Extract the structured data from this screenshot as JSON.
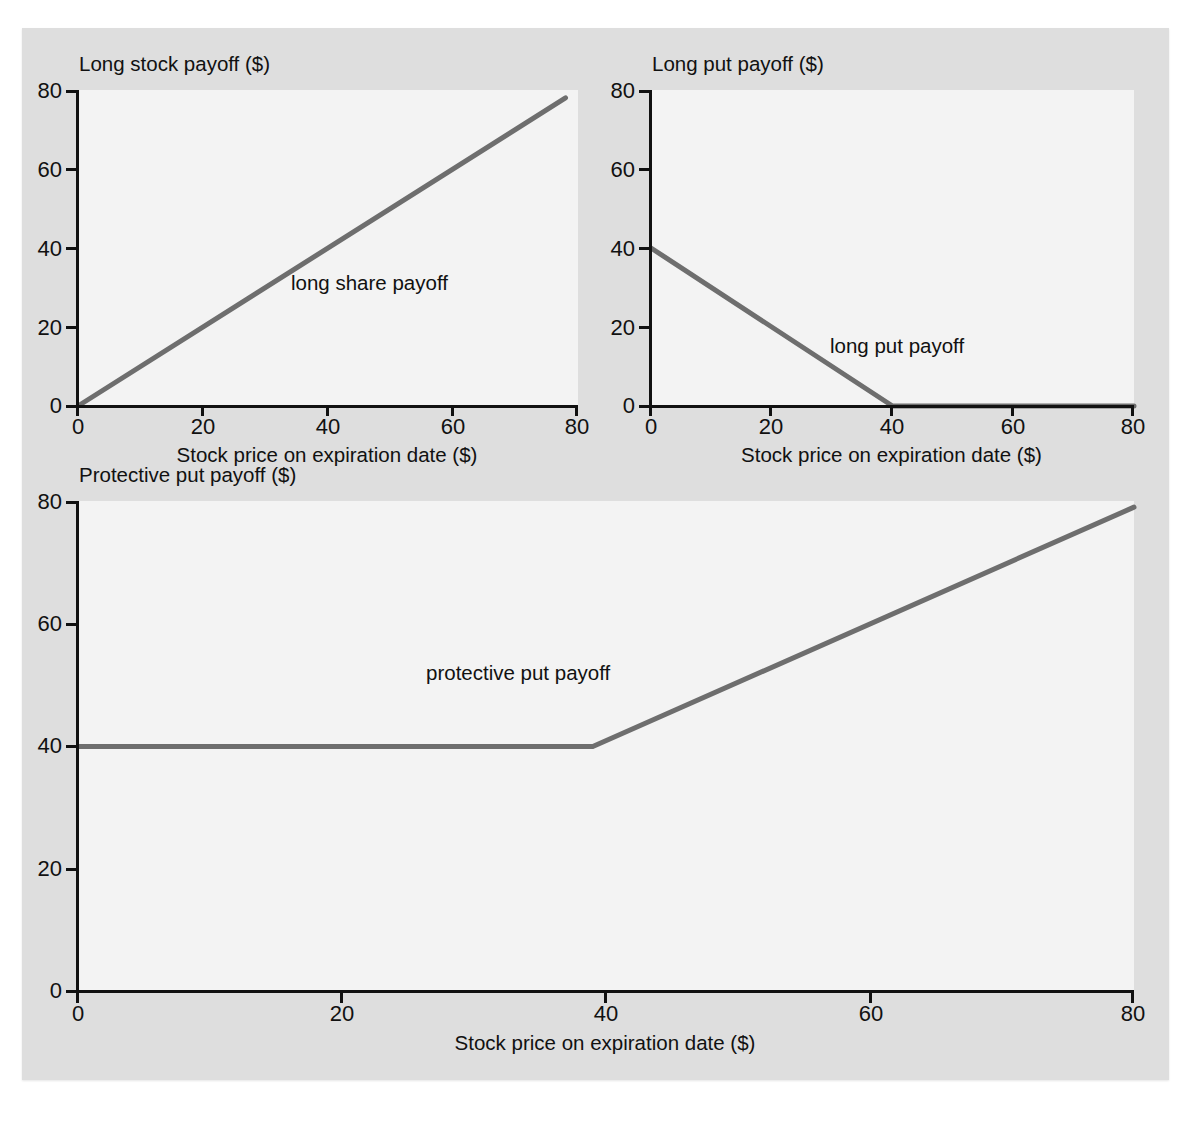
{
  "figure": {
    "cut_off_header_text": "",
    "line_color": "#6e6e6e",
    "axis_color": "#111111",
    "plot_bg_color": "#f3f3f3",
    "figure_bg_color": "#dedede"
  },
  "axis_caption": "Stock price on expiration date ($)",
  "panels": [
    {
      "id": "long-stock",
      "title": "Long stock payoff ($)",
      "annotation": "long share payoff",
      "xlabel": "Stock price on expiration date ($)",
      "xticks": [
        "0",
        "20",
        "40",
        "60",
        "80"
      ],
      "yticks": [
        "80",
        "60",
        "40",
        "20",
        "0"
      ]
    },
    {
      "id": "long-put",
      "title": "Long put payoff ($)",
      "annotation": "long put payoff",
      "xlabel": "Stock price on expiration date ($)",
      "xticks": [
        "0",
        "20",
        "40",
        "60",
        "80"
      ],
      "yticks": [
        "80",
        "60",
        "40",
        "20",
        "0"
      ]
    },
    {
      "id": "protective-put",
      "title": "Protective put payoff ($)",
      "annotation": "protective put payoff",
      "xlabel": "Stock price on expiration date ($)",
      "xticks": [
        "0",
        "20",
        "40",
        "60",
        "80"
      ],
      "yticks": [
        "80",
        "60",
        "40",
        "20",
        "0"
      ]
    }
  ],
  "chart_data": [
    {
      "type": "line",
      "title": "Long stock payoff ($)",
      "xlabel": "Stock price on expiration date ($)",
      "ylabel": "Long stock payoff ($)",
      "xlim": [
        0,
        80
      ],
      "ylim": [
        0,
        80
      ],
      "xticks": [
        0,
        20,
        40,
        60,
        80
      ],
      "yticks": [
        0,
        20,
        40,
        60,
        80
      ],
      "grid": false,
      "legend": "none",
      "annotations": [
        {
          "text": "long share payoff",
          "x": 34,
          "y": 31
        }
      ],
      "series": [
        {
          "name": "long share payoff",
          "color": "#6e6e6e",
          "x": [
            0,
            78
          ],
          "values": [
            0,
            78
          ]
        }
      ]
    },
    {
      "type": "line",
      "title": "Long put payoff ($)",
      "xlabel": "Stock price on expiration date ($)",
      "ylabel": "Long put payoff ($)",
      "xlim": [
        0,
        80
      ],
      "ylim": [
        0,
        80
      ],
      "xticks": [
        0,
        20,
        40,
        60,
        80
      ],
      "yticks": [
        0,
        20,
        40,
        60,
        80
      ],
      "grid": false,
      "legend": "none",
      "annotations": [
        {
          "text": "long put payoff",
          "x": 46,
          "y": 15
        }
      ],
      "series": [
        {
          "name": "long put payoff",
          "color": "#6e6e6e",
          "x": [
            0,
            40,
            80
          ],
          "values": [
            40,
            0,
            0
          ]
        }
      ]
    },
    {
      "type": "line",
      "title": "Protective put payoff ($)",
      "xlabel": "Stock price on expiration date ($)",
      "ylabel": "Protective put payoff ($)",
      "xlim": [
        0,
        80
      ],
      "ylim": [
        0,
        80
      ],
      "xticks": [
        0,
        20,
        40,
        60,
        80
      ],
      "yticks": [
        0,
        20,
        40,
        60,
        80
      ],
      "grid": false,
      "legend": "none",
      "annotations": [
        {
          "text": "protective put payoff",
          "x": 30,
          "y": 52
        }
      ],
      "series": [
        {
          "name": "protective put payoff",
          "color": "#6e6e6e",
          "x": [
            0,
            39,
            80
          ],
          "values": [
            40,
            40,
            79
          ]
        }
      ]
    }
  ]
}
